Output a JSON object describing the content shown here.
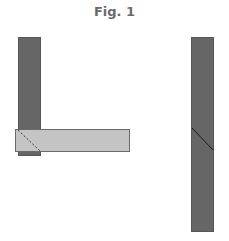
{
  "figure": {
    "title": "Fig. 1",
    "colors": {
      "dark_member": "#666666",
      "light_member": "#c4c4c4",
      "outline": "#555555",
      "joint_line": "#222222"
    },
    "left_assembly": {
      "description": "vertical dark member with horizontal light member overlapping at its base, dashed diagonal hidden joint line"
    },
    "right_assembly": {
      "description": "single vertical dark member with a solid diagonal scarf joint line"
    }
  }
}
